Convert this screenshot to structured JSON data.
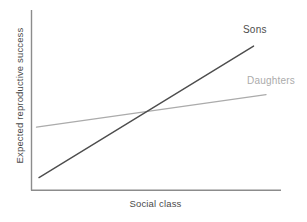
{
  "chart_data": {
    "type": "line",
    "title": "",
    "subtitle": "",
    "xlabel": "Social class",
    "ylabel": "Expected reproductive success",
    "xlim": [
      0,
      1
    ],
    "ylim": [
      0,
      1
    ],
    "grid": false,
    "axis_ticks": false,
    "tick_labels": {
      "x": [],
      "y": []
    },
    "legend": "inline-end-of-line",
    "x": [
      0,
      1
    ],
    "series": [
      {
        "name": "Sons",
        "label": "Sons",
        "color": "#4d4d4d",
        "x": [
          0.03,
          0.89
        ],
        "values": [
          0.07,
          0.8
        ],
        "slope": "steep",
        "annotation": "Sons"
      },
      {
        "name": "Daughters",
        "label": "Daughters",
        "color": "#ababab",
        "x": [
          0.02,
          0.94
        ],
        "values": [
          0.35,
          0.53
        ],
        "slope": "shallow",
        "annotation": "Daughters"
      }
    ],
    "annotations": [
      {
        "text": "Sons",
        "x": 0.85,
        "y": 0.88
      },
      {
        "text": "Daughters",
        "x": 0.87,
        "y": 0.62
      }
    ],
    "crossing_point": {
      "x": 0.485,
      "y": 0.445
    },
    "axes": {
      "x_axis_color": "#8c8c8c",
      "y_axis_color": "#8c8c8c"
    }
  },
  "figure": {
    "background": "#ffffff",
    "x_axis_label": "Social class",
    "y_axis_label": "Expected reproductive success",
    "sons_label": "Sons",
    "daughters_label": "Daughters",
    "sons_color": "#4d4d4d",
    "daughters_color": "#ababab",
    "axis_color": "#8c8c8c"
  }
}
